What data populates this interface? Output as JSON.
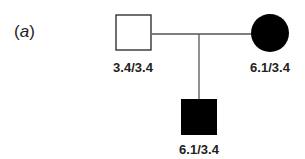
{
  "panel": {
    "open": "(",
    "letter": "a",
    "close": ")"
  },
  "pedigree": {
    "father": {
      "sex": "male",
      "affected": false,
      "genotype": "3.4/3.4"
    },
    "mother": {
      "sex": "female",
      "affected": true,
      "genotype": "6.1/3.4"
    },
    "child": {
      "sex": "male",
      "affected": true,
      "genotype": "6.1/3.4"
    }
  },
  "colors": {
    "line": "#555555",
    "affected_fill": "#000000",
    "unaffected_fill": "#ffffff",
    "text": "#222222"
  }
}
